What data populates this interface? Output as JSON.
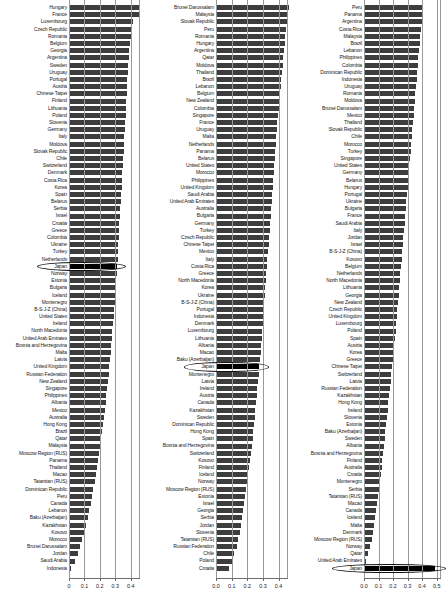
{
  "figure": {
    "type": "grouped-horizontal-bar-panels",
    "panel_count": 3,
    "highlight_country": "Japan",
    "bar_color": "#3d3d3d",
    "highlight_color": "#000000"
  },
  "chart_data": [
    {
      "type": "bar",
      "orientation": "horizontal",
      "panel": 1,
      "title": "",
      "xlabel": "",
      "ylabel": "",
      "xlim": [
        0,
        0.46
      ],
      "ticks": [
        "0",
        "0.1",
        "0.2",
        "0.3",
        "0.4"
      ],
      "tickvals": [
        0,
        0.1,
        0.2,
        0.3,
        0.4
      ],
      "grid": true,
      "highlight": "Japan",
      "categories": [
        "Hungary",
        "France",
        "Luxembourg",
        "Czech Republic",
        "Romania",
        "Belgium",
        "Georgia",
        "Argentina",
        "Sweden",
        "Uruguay",
        "Portugal",
        "Austria",
        "Chinese Taipei",
        "Finland",
        "Lithuania",
        "Poland",
        "Slovenia",
        "Germany",
        "Italy",
        "Moldova",
        "Slovak Republic",
        "Chile",
        "Switzerland",
        "Denmark",
        "Costa Rica",
        "Korea",
        "Spain",
        "Belarus",
        "Serbia",
        "Israel",
        "Croatia",
        "Greece",
        "Colombia",
        "Ukraine",
        "Turkey",
        "Netherlands",
        "Japan",
        "Norway",
        "Estonia",
        "Bulgaria",
        "Iceland",
        "Montenegro",
        "B-S-J-Z (China)",
        "United States",
        "Ireland",
        "North Macedonia",
        "United Arab Emirates",
        "Bosnia and Herzegovina",
        "Malta",
        "Latvia",
        "United Kingdom",
        "Russian Federation",
        "New Zealand",
        "Singapore",
        "Philippines",
        "Albania",
        "Mexico",
        "Australia",
        "Hong Kong",
        "Brazil",
        "Qatar",
        "Malaysia",
        "Moscow Region (RUS)",
        "Panama",
        "Thailand",
        "Macao",
        "Tatarstan (RUS)",
        "Dominican Republic",
        "Peru",
        "Canada",
        "Lebanon",
        "Baku (Azerbaijan)",
        "Kazakhstan",
        "Kosovo",
        "Morocco",
        "Brunei Darussalam",
        "Jordan",
        "Saudi Arabia",
        "Indonesia"
      ],
      "values": [
        0.415,
        0.408,
        0.372,
        0.368,
        0.362,
        0.358,
        0.349,
        0.347,
        0.344,
        0.342,
        0.34,
        0.338,
        0.336,
        0.334,
        0.332,
        0.33,
        0.327,
        0.325,
        0.323,
        0.321,
        0.319,
        0.316,
        0.314,
        0.311,
        0.309,
        0.306,
        0.303,
        0.3,
        0.298,
        0.296,
        0.294,
        0.292,
        0.29,
        0.288,
        0.285,
        0.283,
        0.281,
        0.278,
        0.275,
        0.272,
        0.269,
        0.266,
        0.263,
        0.26,
        0.257,
        0.253,
        0.25,
        0.247,
        0.243,
        0.238,
        0.234,
        0.23,
        0.226,
        0.222,
        0.218,
        0.214,
        0.21,
        0.206,
        0.2,
        0.194,
        0.188,
        0.182,
        0.176,
        0.17,
        0.164,
        0.158,
        0.15,
        0.142,
        0.134,
        0.126,
        0.118,
        0.11,
        0.1,
        0.09,
        0.078,
        0.064,
        0.05,
        0.035,
        0.012
      ]
    },
    {
      "type": "bar",
      "orientation": "horizontal",
      "panel": 2,
      "title": "",
      "xlabel": "",
      "ylabel": "",
      "xlim": [
        0,
        0.46
      ],
      "ticks": [
        "0.0",
        "0.1",
        "0.2",
        "0.3",
        "0.4"
      ],
      "tickvals": [
        0,
        0.1,
        0.2,
        0.3,
        0.4
      ],
      "grid": true,
      "highlight": "Japan",
      "categories": [
        "Brunei Darussalam",
        "Malaysia",
        "Slovak Republic",
        "Peru",
        "Romania",
        "Hungary",
        "Argentina",
        "Qatar",
        "Moldova",
        "Thailand",
        "Brazil",
        "Lebanon",
        "Belgium",
        "New Zealand",
        "Colombia",
        "Singapore",
        "France",
        "Uruguay",
        "Malta",
        "Netherlands",
        "Panama",
        "Belarus",
        "United States",
        "Morocco",
        "Philippines",
        "United Kingdom",
        "Saudi Arabia",
        "United Arab Emirates",
        "Australia",
        "Bulgaria",
        "Germany",
        "Turkey",
        "Czech Republic",
        "Chinese Taipei",
        "Mexico",
        "Italy",
        "Costa Rica",
        "Greece",
        "North Macedonia",
        "Korea",
        "Ukraine",
        "B-S-J-Z (China)",
        "Portugal",
        "Indonesia",
        "Denmark",
        "Luxembourg",
        "Lithuania",
        "Albania",
        "Macao",
        "Baku (Azerbaijan)",
        "Japan",
        "Montenegro",
        "Latvia",
        "Ireland",
        "Austria",
        "Canada",
        "Kazakhstan",
        "Sweden",
        "Dominican Republic",
        "Hong Kong",
        "Spain",
        "Bosnia and Herzegovina",
        "Switzerland",
        "Kosovo",
        "Finland",
        "Iceland",
        "Norway",
        "Moscow Region (RUS)",
        "Estonia",
        "Israel",
        "Georgia",
        "Serbia",
        "Jordan",
        "Slovenia",
        "Tatarstan (RUS)",
        "Russian Federation",
        "Chile",
        "Poland",
        "Croatia"
      ],
      "values": [
        0.42,
        0.414,
        0.408,
        0.403,
        0.399,
        0.395,
        0.391,
        0.387,
        0.383,
        0.379,
        0.375,
        0.371,
        0.367,
        0.364,
        0.36,
        0.357,
        0.353,
        0.35,
        0.347,
        0.344,
        0.341,
        0.338,
        0.335,
        0.332,
        0.329,
        0.326,
        0.323,
        0.32,
        0.317,
        0.314,
        0.311,
        0.308,
        0.305,
        0.302,
        0.299,
        0.296,
        0.293,
        0.29,
        0.287,
        0.284,
        0.281,
        0.278,
        0.275,
        0.272,
        0.269,
        0.266,
        0.263,
        0.26,
        0.257,
        0.253,
        0.25,
        0.246,
        0.242,
        0.238,
        0.234,
        0.23,
        0.226,
        0.222,
        0.218,
        0.214,
        0.21,
        0.205,
        0.2,
        0.195,
        0.19,
        0.185,
        0.18,
        0.174,
        0.168,
        0.162,
        0.156,
        0.15,
        0.143,
        0.136,
        0.128,
        0.118,
        0.106,
        0.092,
        0.075
      ]
    },
    {
      "type": "bar",
      "orientation": "horizontal",
      "panel": 3,
      "title": "",
      "xlabel": "",
      "ylabel": "",
      "xlim": [
        0,
        0.53
      ],
      "ticks": [
        "0.0",
        "0.1",
        "0.2",
        "0.3",
        "0.4",
        "0.5"
      ],
      "tickvals": [
        0,
        0.1,
        0.2,
        0.3,
        0.4,
        0.5
      ],
      "grid": true,
      "highlight": "Japan",
      "categories": [
        "Peru",
        "Panama",
        "Argentina",
        "Costa Rica",
        "Malaysia",
        "Brazil",
        "Lebanon",
        "Philippines",
        "Colombia",
        "Dominican Republic",
        "Indonesia",
        "Uruguay",
        "Romania",
        "Moldova",
        "Brunei Darussalam",
        "Mexico",
        "Thailand",
        "Slovak Republic",
        "Chile",
        "Morocco",
        "Turkey",
        "Singapore",
        "United States",
        "Germany",
        "Belarus",
        "Hungary",
        "Portugal",
        "Ukraine",
        "Bulgaria",
        "France",
        "Saudi Arabia",
        "Italy",
        "Jordan",
        "Israel",
        "B-S-J-Z (China)",
        "Kosovo",
        "Belgium",
        "Netherlands",
        "North Macedonia",
        "Lithuania",
        "Georgia",
        "New Zealand",
        "Czech Republic",
        "United Kingdom",
        "Luxembourg",
        "Poland",
        "Spain",
        "Austria",
        "Korea",
        "Greece",
        "Chinese Taipei",
        "Switzerland",
        "Latvia",
        "Russian Federation",
        "Kazakhstan",
        "Hong Kong",
        "Ireland",
        "Slovenia",
        "Estonia",
        "Baku (Azerbaijan)",
        "Sweden",
        "Albania",
        "Bosnia and Herzegovina",
        "Finland",
        "Australia",
        "Croatia",
        "Montenegro",
        "Serbia",
        "Tatarstan (RUS)",
        "Macao",
        "Canada",
        "Iceland",
        "Malta",
        "Denmark",
        "Moscow Region (RUS)",
        "Norway",
        "Qatar",
        "United Arab Emirates",
        "Japan"
      ],
      "values": [
        0.392,
        0.386,
        0.381,
        0.377,
        0.373,
        0.369,
        0.365,
        0.361,
        0.357,
        0.353,
        0.349,
        0.345,
        0.341,
        0.337,
        0.333,
        0.329,
        0.325,
        0.321,
        0.317,
        0.313,
        0.309,
        0.305,
        0.301,
        0.297,
        0.293,
        0.289,
        0.285,
        0.281,
        0.277,
        0.273,
        0.269,
        0.265,
        0.261,
        0.257,
        0.253,
        0.249,
        0.245,
        0.241,
        0.237,
        0.233,
        0.229,
        0.225,
        0.221,
        0.217,
        0.213,
        0.209,
        0.205,
        0.201,
        0.196,
        0.191,
        0.186,
        0.181,
        0.176,
        0.171,
        0.166,
        0.161,
        0.156,
        0.151,
        0.146,
        0.141,
        0.136,
        0.131,
        0.126,
        0.121,
        0.116,
        0.11,
        0.104,
        0.098,
        0.092,
        0.086,
        0.08,
        0.073,
        0.066,
        0.058,
        0.05,
        0.04,
        0.024,
        0.01,
        0.47
      ]
    }
  ]
}
